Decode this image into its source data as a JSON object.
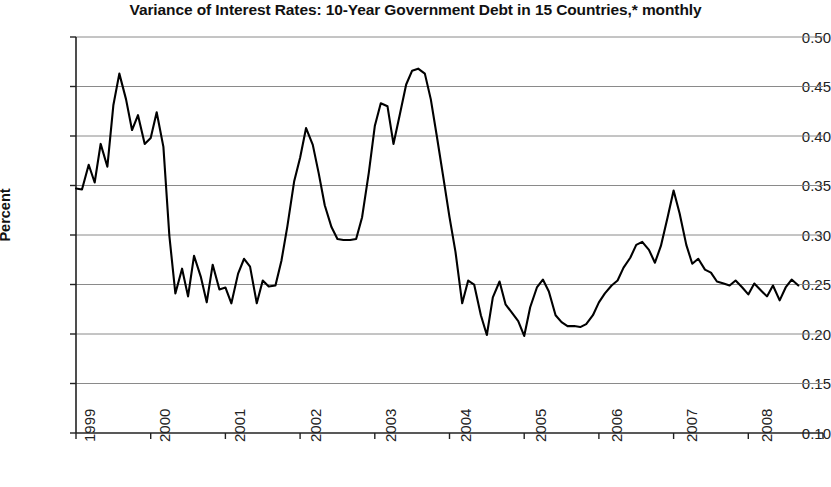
{
  "chart_data": {
    "type": "line",
    "title": "Variance of Interest Rates: 10-Year Government Debt in 15 Countries,* monthly",
    "xlabel": "",
    "ylabel": "Percent",
    "xlim": [
      1999.0,
      2009.0
    ],
    "ylim": [
      0.1,
      0.5
    ],
    "grid": true,
    "legend": false,
    "y_ticks": [
      "0.50",
      "0.45",
      "0.40",
      "0.35",
      "0.30",
      "0.25",
      "0.20",
      "0.15",
      "0.10"
    ],
    "y_tick_values": [
      0.5,
      0.45,
      0.4,
      0.35,
      0.3,
      0.25,
      0.2,
      0.15,
      0.1
    ],
    "x_ticks": [
      "1999",
      "2000",
      "2001",
      "2002",
      "2003",
      "2004",
      "2005",
      "2006",
      "2007",
      "2008",
      "2009"
    ],
    "x_tick_values": [
      1999,
      2000,
      2001,
      2002,
      2003,
      2004,
      2005,
      2006,
      2007,
      2008,
      2009
    ],
    "series": [
      {
        "name": "Variance of interest rates",
        "color": "#000000",
        "x": [
          1999.0,
          1999.08,
          1999.17,
          1999.25,
          1999.33,
          1999.42,
          1999.5,
          1999.58,
          1999.67,
          1999.75,
          1999.83,
          1999.92,
          2000.0,
          2000.08,
          2000.17,
          2000.25,
          2000.33,
          2000.42,
          2000.5,
          2000.58,
          2000.67,
          2000.75,
          2000.83,
          2000.92,
          2001.0,
          2001.08,
          2001.17,
          2001.25,
          2001.33,
          2001.42,
          2001.5,
          2001.58,
          2001.67,
          2001.75,
          2001.83,
          2001.92,
          2002.0,
          2002.08,
          2002.17,
          2002.25,
          2002.33,
          2002.42,
          2002.5,
          2002.58,
          2002.67,
          2002.75,
          2002.83,
          2002.92,
          2003.0,
          2003.08,
          2003.17,
          2003.25,
          2003.33,
          2003.42,
          2003.5,
          2003.58,
          2003.67,
          2003.75,
          2003.83,
          2003.92,
          2004.0,
          2004.08,
          2004.17,
          2004.25,
          2004.33,
          2004.42,
          2004.5,
          2004.58,
          2004.67,
          2004.75,
          2004.83,
          2004.92,
          2005.0,
          2005.08,
          2005.17,
          2005.25,
          2005.33,
          2005.42,
          2005.5,
          2005.58,
          2005.67,
          2005.75,
          2005.83,
          2005.92,
          2006.0,
          2006.08,
          2006.17,
          2006.25,
          2006.33,
          2006.42,
          2006.5,
          2006.58,
          2006.67,
          2006.75,
          2006.83,
          2006.92,
          2007.0,
          2007.08,
          2007.17,
          2007.25,
          2007.33,
          2007.42,
          2007.5,
          2007.58,
          2007.67,
          2007.75,
          2007.83,
          2007.92,
          2008.0,
          2008.08,
          2008.17,
          2008.25,
          2008.33,
          2008.42,
          2008.5,
          2008.58,
          2008.67
        ],
        "values": [
          0.347,
          0.346,
          0.371,
          0.353,
          0.392,
          0.369,
          0.431,
          0.463,
          0.437,
          0.406,
          0.421,
          0.392,
          0.398,
          0.424,
          0.389,
          0.299,
          0.241,
          0.266,
          0.238,
          0.279,
          0.258,
          0.232,
          0.27,
          0.245,
          0.247,
          0.231,
          0.261,
          0.276,
          0.268,
          0.231,
          0.254,
          0.248,
          0.249,
          0.274,
          0.309,
          0.354,
          0.378,
          0.408,
          0.391,
          0.362,
          0.33,
          0.308,
          0.296,
          0.295,
          0.295,
          0.296,
          0.318,
          0.363,
          0.41,
          0.433,
          0.43,
          0.392,
          0.42,
          0.452,
          0.466,
          0.468,
          0.463,
          0.437,
          0.4,
          0.357,
          0.318,
          0.283,
          0.231,
          0.254,
          0.25,
          0.219,
          0.199,
          0.237,
          0.253,
          0.23,
          0.222,
          0.213,
          0.198,
          0.227,
          0.247,
          0.255,
          0.243,
          0.219,
          0.212,
          0.208,
          0.208,
          0.207,
          0.21,
          0.219,
          0.232,
          0.241,
          0.249,
          0.254,
          0.267,
          0.277,
          0.29,
          0.293,
          0.285,
          0.272,
          0.289,
          0.318,
          0.345,
          0.322,
          0.29,
          0.271,
          0.276,
          0.265,
          0.262,
          0.253,
          0.251,
          0.249,
          0.254,
          0.247,
          0.24,
          0.251,
          0.244,
          0.238,
          0.249,
          0.234,
          0.247,
          0.255,
          0.249
        ]
      }
    ],
    "annotations": []
  }
}
